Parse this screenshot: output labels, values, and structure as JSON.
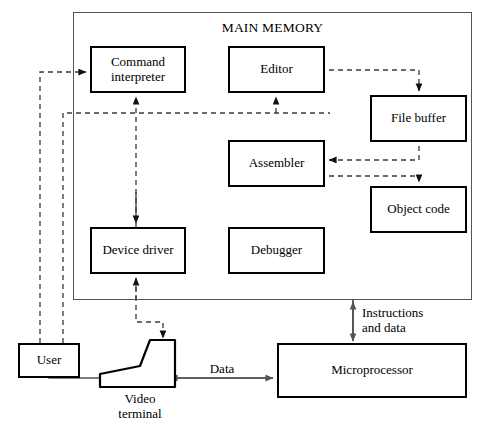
{
  "diagram": {
    "title": "MAIN MEMORY",
    "container_label": "MAIN MEMORY",
    "boxes": {
      "command_interpreter": "Command\ninterpreter",
      "editor": "Editor",
      "file_buffer": "File\nbuffer",
      "assembler": "Assembler",
      "object_code": "Object\ncode",
      "device_driver": "Device\ndriver",
      "debugger": "Debugger",
      "user": "User",
      "microprocessor": "Microprocessor"
    },
    "labels": {
      "instructions_and_data": "Instructions\nand data",
      "data": "Data",
      "video_terminal": "Video\nterminal"
    },
    "colors": {
      "stroke": "#000000",
      "container_stroke": "#555555",
      "background": "#ffffff",
      "dashed_stroke": "#444444",
      "solid_connector": "#555555"
    }
  }
}
